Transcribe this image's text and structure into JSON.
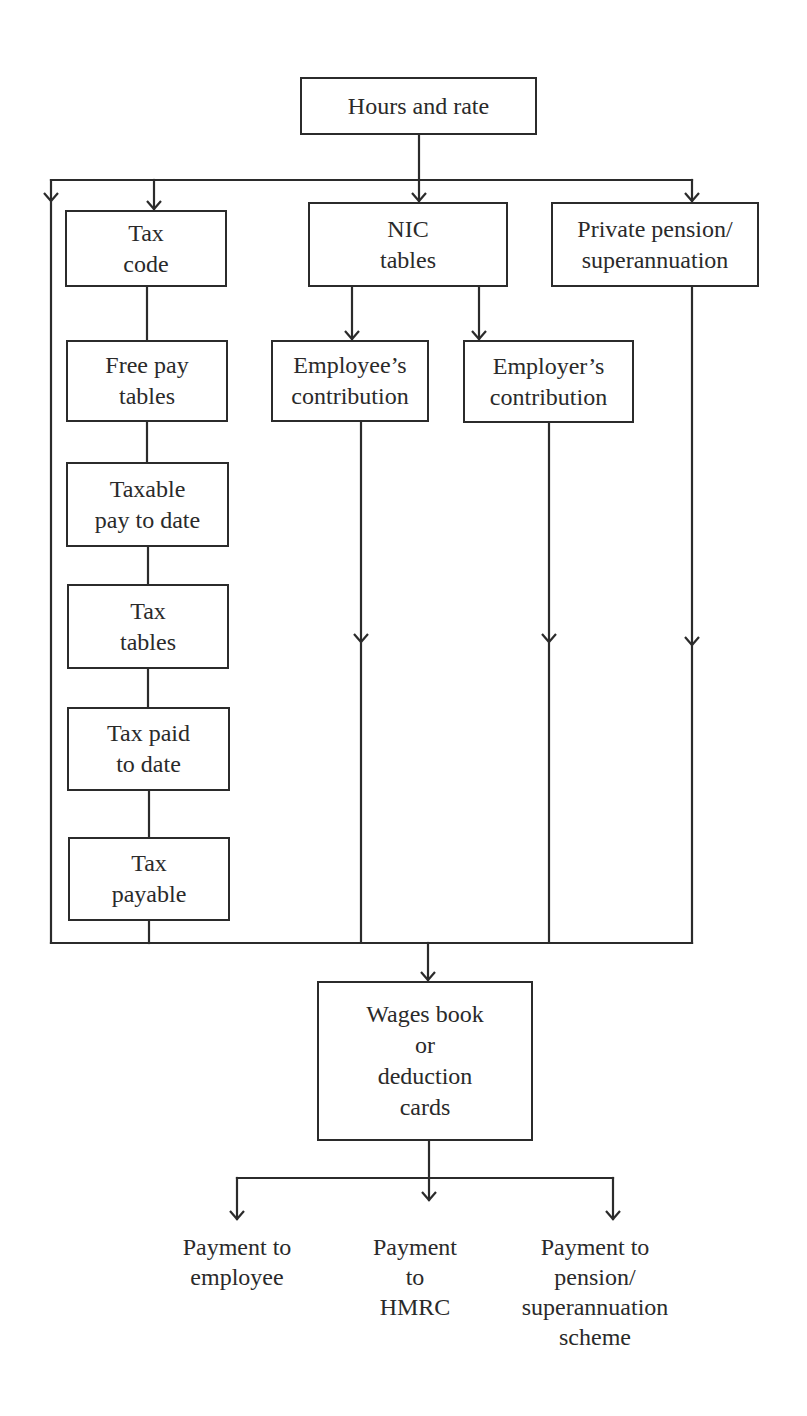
{
  "diagram": {
    "type": "flowchart",
    "nodes": {
      "hours_rate": {
        "lines": [
          "Hours and rate"
        ]
      },
      "tax_code": {
        "lines": [
          "Tax",
          "code"
        ]
      },
      "free_pay": {
        "lines": [
          "Free pay",
          "tables"
        ]
      },
      "taxable_pay": {
        "lines": [
          "Taxable",
          "pay to date"
        ]
      },
      "tax_tables": {
        "lines": [
          "Tax",
          "tables"
        ]
      },
      "tax_paid": {
        "lines": [
          "Tax paid",
          "to date"
        ]
      },
      "tax_payable": {
        "lines": [
          "Tax",
          "payable"
        ]
      },
      "nic_tables": {
        "lines": [
          "NIC",
          "tables"
        ]
      },
      "employee_contribution": {
        "lines": [
          "Employee’s",
          "contribution"
        ]
      },
      "employer_contribution": {
        "lines": [
          "Employer’s",
          "contribution"
        ]
      },
      "private_pension": {
        "lines": [
          "Private pension/",
          "superannuation"
        ]
      },
      "wages_book": {
        "lines": [
          "Wages book",
          "or",
          "deduction",
          "cards"
        ]
      }
    },
    "outputs": {
      "employee": {
        "lines": [
          "Payment to",
          "employee"
        ]
      },
      "hmrc": {
        "lines": [
          "Payment",
          "to",
          "HMRC"
        ]
      },
      "pension_scheme": {
        "lines": [
          "Payment to",
          "pension/",
          "superannuation",
          "scheme"
        ]
      }
    },
    "edges": [
      [
        "hours_rate",
        "bypass_left"
      ],
      [
        "hours_rate",
        "tax_code"
      ],
      [
        "hours_rate",
        "nic_tables"
      ],
      [
        "hours_rate",
        "private_pension"
      ],
      [
        "tax_code",
        "free_pay"
      ],
      [
        "free_pay",
        "taxable_pay"
      ],
      [
        "taxable_pay",
        "tax_tables"
      ],
      [
        "tax_tables",
        "tax_paid"
      ],
      [
        "tax_paid",
        "tax_payable"
      ],
      [
        "nic_tables",
        "employee_contribution"
      ],
      [
        "nic_tables",
        "employer_contribution"
      ],
      [
        "tax_payable",
        "wages_book"
      ],
      [
        "employee_contribution",
        "wages_book"
      ],
      [
        "employer_contribution",
        "wages_book"
      ],
      [
        "private_pension",
        "wages_book"
      ],
      [
        "bypass_left",
        "wages_book"
      ],
      [
        "wages_book",
        "employee"
      ],
      [
        "wages_book",
        "hmrc"
      ],
      [
        "wages_book",
        "pension_scheme"
      ]
    ],
    "colors": {
      "line": "#2b2b2b",
      "text": "#2a2a2a",
      "background": "#ffffff"
    }
  }
}
